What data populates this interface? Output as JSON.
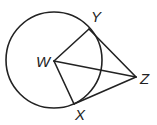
{
  "diagram": {
    "type": "geometry",
    "colors": {
      "stroke": "#222222",
      "background": "#ffffff"
    },
    "circle": {
      "center_label": "W",
      "cx": 54,
      "cy": 60,
      "r": 48
    },
    "points": {
      "W": {
        "label": "W",
        "x": 54,
        "y": 61,
        "label_x": 36,
        "label_y": 67
      },
      "Y": {
        "label": "Y",
        "x": 89,
        "y": 29,
        "label_x": 91,
        "label_y": 22
      },
      "Z": {
        "label": "Z",
        "x": 136,
        "y": 77,
        "label_x": 140,
        "label_y": 84
      },
      "X": {
        "label": "X",
        "x": 74,
        "y": 104,
        "label_x": 75,
        "label_y": 120
      }
    },
    "segments": [
      {
        "name": "WY",
        "from": "W",
        "to": "Y"
      },
      {
        "name": "WX",
        "from": "W",
        "to": "X"
      },
      {
        "name": "WZ",
        "from": "W",
        "to": "Z"
      },
      {
        "name": "YZ",
        "from": "Y",
        "to": "Z"
      },
      {
        "name": "XZ",
        "from": "X",
        "to": "Z"
      }
    ]
  }
}
